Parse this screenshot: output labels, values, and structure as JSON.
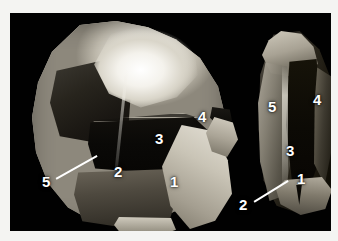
{
  "figure": {
    "kind": "photograph",
    "background_color": "#010101",
    "paper_color": "#ffffff",
    "label_color": "#ffffff"
  },
  "specimens": [
    {
      "id": "left-specimen",
      "name": "main-crystal",
      "labels": [
        {
          "key": "one",
          "text": "1",
          "x": 174,
          "y": 182,
          "leader": false
        },
        {
          "key": "two",
          "text": "2",
          "x": 118,
          "y": 172,
          "leader": false
        },
        {
          "key": "three",
          "text": "3",
          "x": 159,
          "y": 139,
          "leader": false
        },
        {
          "key": "four",
          "text": "4",
          "x": 202,
          "y": 117,
          "leader": false
        },
        {
          "key": "five",
          "text": "5",
          "x": 46,
          "y": 182,
          "leader": true
        }
      ]
    },
    {
      "id": "right-specimen",
      "name": "side-crystal",
      "labels": [
        {
          "key": "one",
          "text": "1",
          "x": 301,
          "y": 179,
          "leader": false
        },
        {
          "key": "two",
          "text": "2",
          "x": 243,
          "y": 205,
          "leader": true
        },
        {
          "key": "three",
          "text": "3",
          "x": 290,
          "y": 151,
          "leader": false
        },
        {
          "key": "four",
          "text": "4",
          "x": 317,
          "y": 100,
          "leader": false
        },
        {
          "key": "five",
          "text": "5",
          "x": 272,
          "y": 107,
          "leader": false
        }
      ]
    }
  ],
  "leaders": [
    {
      "key": "left-leader",
      "from_x": 56,
      "from_y": 178,
      "to_x": 97,
      "to_y": 155
    },
    {
      "key": "right-leader",
      "from_x": 254,
      "from_y": 201,
      "to_x": 288,
      "to_y": 180
    }
  ],
  "callout_values": {
    "l1": "1",
    "l2": "2",
    "l3": "3",
    "l4": "4",
    "l5": "5",
    "r1": "1",
    "r2": "2",
    "r3": "3",
    "r4": "4",
    "r5": "5"
  }
}
